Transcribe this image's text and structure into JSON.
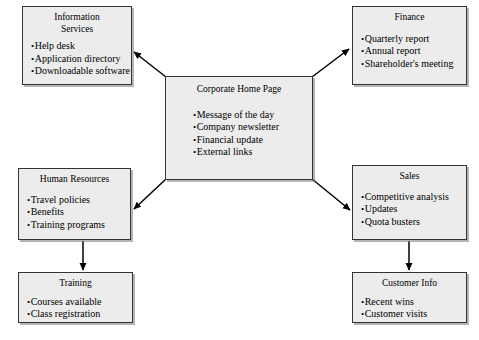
{
  "diagram": {
    "type": "site-map-hierarchy",
    "colors": {
      "node_fill": "#ececec",
      "node_border": "#333333",
      "node_shadow": "#787878",
      "edge": "#000000",
      "background": "#ffffff",
      "text": "#000000"
    },
    "nodes": [
      {
        "id": "information-services",
        "title": "Information\nServices",
        "items": [
          "Help desk",
          "Application directory",
          "Downloadable software"
        ]
      },
      {
        "id": "finance",
        "title": "Finance",
        "items": [
          "Quarterly report",
          "Annual report",
          "Shareholder's meeting"
        ]
      },
      {
        "id": "corporate-home-page",
        "title": "Corporate Home Page",
        "items": [
          "Message of the day",
          "Company newsletter",
          "Financial update",
          "External links"
        ]
      },
      {
        "id": "human-resources",
        "title": "Human Resources",
        "items": [
          "Travel policies",
          "Benefits",
          "Training programs"
        ]
      },
      {
        "id": "sales",
        "title": "Sales",
        "items": [
          "Competitive analysis",
          "Updates",
          "Quota busters"
        ]
      },
      {
        "id": "training",
        "title": "Training",
        "items": [
          "Courses available",
          "Class registration"
        ]
      },
      {
        "id": "customer-info",
        "title": "Customer Info",
        "items": [
          "Recent wins",
          "Customer visits"
        ]
      }
    ],
    "edges": [
      {
        "from": "corporate-home-page",
        "to": "information-services",
        "arrow": "to"
      },
      {
        "from": "corporate-home-page",
        "to": "finance",
        "arrow": "to"
      },
      {
        "from": "corporate-home-page",
        "to": "human-resources",
        "arrow": "to"
      },
      {
        "from": "corporate-home-page",
        "to": "sales",
        "arrow": "to"
      },
      {
        "from": "human-resources",
        "to": "training",
        "arrow": "to"
      },
      {
        "from": "sales",
        "to": "customer-info",
        "arrow": "to"
      }
    ]
  }
}
